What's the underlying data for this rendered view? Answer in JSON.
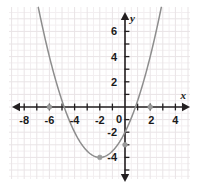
{
  "figure": {
    "kind": "coordinate-plane-graph",
    "background": "#ffffff",
    "panel_fill": "#ffffff",
    "grid_major_color": "#e9e4e6",
    "grid_minor_color": "#f3eff1",
    "axis_color": "#231f20",
    "curve_color": "#8d8d8d",
    "point_color": "#9a9a9a",
    "label_color": "#1a1a1a"
  },
  "axes": {
    "x_label": "x",
    "y_label": "y",
    "origin_label": "0",
    "x_ticks": [
      "-8",
      "-6",
      "-4",
      "-2",
      "4"
    ],
    "x_tick_values": [
      -8,
      -6,
      -4,
      -2,
      4
    ],
    "y_ticks": [
      "6",
      "4",
      "2",
      "-2",
      "-4"
    ],
    "y_tick_values": [
      6,
      4,
      2,
      -2,
      -4
    ],
    "x_extra_ticks": [
      "2"
    ],
    "xlim": [
      -9.2,
      5.2
    ],
    "ylim": [
      -5.5,
      7.8
    ],
    "x_arrows": [
      "left",
      "right"
    ],
    "y_arrows": [
      "up",
      "down"
    ],
    "grid": true,
    "minor_grid_step": 0.5,
    "major_grid_step": 1
  },
  "chart_data": {
    "type": "line",
    "title": "",
    "xlabel": "x",
    "ylabel": "y",
    "xlim": [
      -9.2,
      5.2
    ],
    "ylim": [
      -5.5,
      7.8
    ],
    "grid": true,
    "legend": "none",
    "curve": {
      "name": "parabola",
      "equation": "y = 0.5(x + 2)^2 - 4",
      "a": 0.5,
      "h": -2,
      "k": -4,
      "vertex": [
        -2,
        -4
      ],
      "roots": [
        -6,
        2
      ],
      "y_intercept": [
        0,
        -3
      ],
      "opens": "up",
      "x": [
        -9,
        -8.5,
        -8,
        -7.5,
        -7,
        -6.5,
        -6,
        -5.5,
        -5,
        -4.5,
        -4,
        -3.5,
        -3,
        -2.5,
        -2,
        -1.5,
        -1,
        -0.5,
        0,
        0.5,
        1,
        1.5,
        2,
        2.5,
        3,
        3.5,
        4,
        4.5,
        5
      ],
      "y": [
        20.5,
        17.1,
        14,
        11.1,
        8.5,
        6.1,
        4,
        2.1,
        0.5,
        -0.9,
        -2,
        -2.9,
        -3.5,
        -3.9,
        -4,
        -3.9,
        -3.5,
        -2.9,
        -2,
        -0.9,
        0.5,
        2.1,
        4,
        6.1,
        8.5,
        11.1,
        14,
        17.1,
        20.5
      ]
    },
    "marked_points": [
      {
        "label": "root-left",
        "x": -6,
        "y": 0
      },
      {
        "label": "vertex",
        "x": -2,
        "y": -4
      },
      {
        "label": "y-intercept",
        "x": 0,
        "y": -3
      },
      {
        "label": "root-right",
        "x": 2,
        "y": 0
      }
    ],
    "x_tick_labels": [
      "-8",
      "-6",
      "-4",
      "-2",
      "0",
      "2",
      "4"
    ],
    "y_tick_labels": [
      "6",
      "4",
      "2",
      "0",
      "-2",
      "-4"
    ]
  }
}
